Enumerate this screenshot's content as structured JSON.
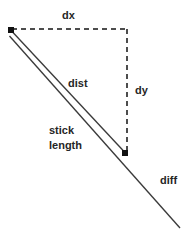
{
  "figure": {
    "kind": "geometry-diagram",
    "background_color": "#ffffff",
    "stroke_color": "#333333",
    "dash_color": "#4d4d4d",
    "marker_color": "#111111",
    "text_color": "#262626",
    "width": 188,
    "height": 242
  },
  "labels": {
    "dx": "dx",
    "dy": "dy",
    "dist": "dist",
    "stick_line1": "stick",
    "stick_line2": "length",
    "diff": "diff"
  },
  "geometry": {
    "point_a": {
      "x": 11,
      "y": 30
    },
    "point_b": {
      "x": 125,
      "y": 153
    },
    "line_end": {
      "x": 180,
      "y": 228
    },
    "dx_dash": {
      "x1": 12,
      "y1": 29,
      "x2": 127,
      "y2": 29
    },
    "dy_dash": {
      "x1": 127,
      "y1": 30,
      "x2": 127,
      "y2": 152
    },
    "stick_upper": {
      "x1": 13,
      "y1": 33,
      "x2": 124,
      "y2": 152
    },
    "stick_lower": {
      "x1": 9,
      "y1": 37,
      "x2": 180,
      "y2": 228
    },
    "marker_size": 6
  },
  "label_positions": {
    "dx": {
      "left": 62,
      "top": 9
    },
    "dy": {
      "left": 135,
      "top": 84
    },
    "dist": {
      "left": 68,
      "top": 77
    },
    "stick": {
      "left": 49,
      "top": 123
    },
    "diff": {
      "left": 160,
      "top": 174
    }
  }
}
